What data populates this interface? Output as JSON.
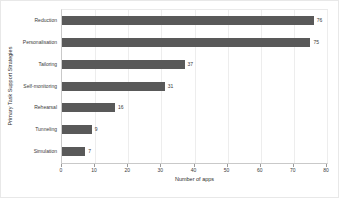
{
  "chart_data": {
    "type": "bar",
    "orientation": "horizontal",
    "title": "",
    "xlabel": "Number of apps",
    "ylabel": "Primary Task Support Strategies",
    "categories": [
      "Reduction",
      "Personalisation",
      "Tailoring",
      "Self-monitoring",
      "Rehearsal",
      "Tunneling",
      "Simulation"
    ],
    "values": [
      76,
      75,
      37,
      31,
      16,
      9,
      7
    ],
    "value_labels": [
      "76",
      "75",
      "37",
      "31",
      "16",
      "9",
      "7"
    ],
    "xlim": [
      0,
      80
    ],
    "xticks": [
      0,
      10,
      20,
      30,
      40,
      50,
      60,
      70,
      80
    ],
    "xtick_labels": [
      "0",
      "10",
      "20",
      "30",
      "40",
      "50",
      "60",
      "70",
      "80"
    ],
    "grid": true,
    "legend": false,
    "bar_color": "#595959",
    "grid_color": "#ededed",
    "axis_color": "#c9c9c9",
    "text_color": "#3a3a3a",
    "background": "#ffffff"
  }
}
